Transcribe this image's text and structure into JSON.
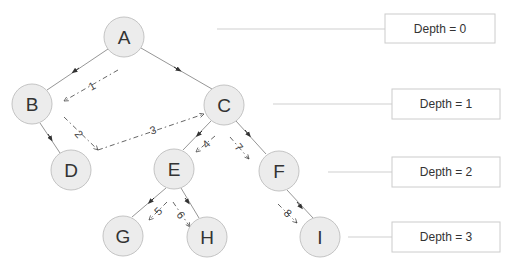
{
  "diagram": {
    "type": "tree-depth-first-traversal",
    "nodes": [
      {
        "id": "A",
        "label": "A",
        "x": 124,
        "y": 37,
        "depth": 0
      },
      {
        "id": "B",
        "label": "B",
        "x": 32,
        "y": 104,
        "depth": 1
      },
      {
        "id": "C",
        "label": "C",
        "x": 224,
        "y": 105,
        "depth": 1
      },
      {
        "id": "D",
        "label": "D",
        "x": 71,
        "y": 170,
        "depth": 2
      },
      {
        "id": "E",
        "label": "E",
        "x": 174,
        "y": 169,
        "depth": 2
      },
      {
        "id": "F",
        "label": "F",
        "x": 279,
        "y": 171,
        "depth": 2
      },
      {
        "id": "G",
        "label": "G",
        "x": 123,
        "y": 236,
        "depth": 3
      },
      {
        "id": "H",
        "label": "H",
        "x": 207,
        "y": 237,
        "depth": 3
      },
      {
        "id": "I",
        "label": "I",
        "x": 320,
        "y": 237,
        "depth": 3
      }
    ],
    "edges": [
      {
        "from": "A",
        "to": "B"
      },
      {
        "from": "A",
        "to": "C"
      },
      {
        "from": "B",
        "to": "D"
      },
      {
        "from": "C",
        "to": "E"
      },
      {
        "from": "C",
        "to": "F"
      },
      {
        "from": "E",
        "to": "G"
      },
      {
        "from": "E",
        "to": "H"
      },
      {
        "from": "F",
        "to": "I"
      }
    ],
    "traversal_steps": [
      {
        "step": "1",
        "from": "A",
        "to": "B"
      },
      {
        "step": "2",
        "from": "B",
        "to": "D"
      },
      {
        "step": "3",
        "from": "D",
        "to": "C"
      },
      {
        "step": "4",
        "from": "C",
        "to": "E"
      },
      {
        "step": "5",
        "from": "E",
        "to": "G"
      },
      {
        "step": "6",
        "from": "E",
        "to": "H"
      },
      {
        "step": "7",
        "from": "C",
        "to": "F"
      },
      {
        "step": "8",
        "from": "F",
        "to": "I"
      }
    ],
    "depth_labels": [
      {
        "text": "Depth = 0",
        "line_x1": 217,
        "y": 29,
        "box_x": 385,
        "box_y": 14,
        "box_w": 110,
        "box_h": 29
      },
      {
        "text": "Depth = 1",
        "line_x1": 273,
        "y": 104,
        "box_x": 392,
        "box_y": 89,
        "box_w": 108,
        "box_h": 30
      },
      {
        "text": "Depth = 2",
        "line_x1": 328,
        "y": 172,
        "box_x": 392,
        "box_y": 157,
        "box_w": 108,
        "box_h": 30
      },
      {
        "text": "Depth = 3",
        "line_x1": 348,
        "y": 237,
        "box_x": 392,
        "box_y": 222,
        "box_w": 108,
        "box_h": 30
      }
    ],
    "colors": {
      "node_fill": "#ececec",
      "node_stroke": "#c4c4c4",
      "edge": "#8a8a8a",
      "traversal": "#555555",
      "depth_box_stroke": "#cccccc"
    }
  }
}
